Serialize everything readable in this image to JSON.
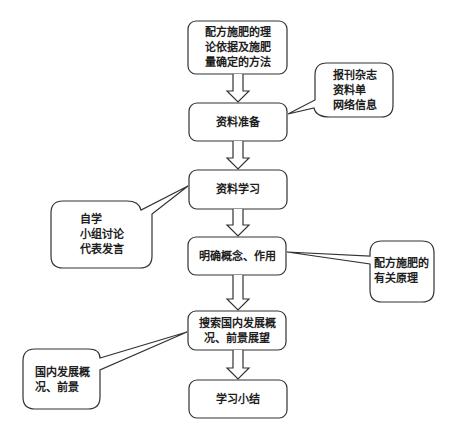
{
  "diagram": {
    "type": "flowchart",
    "steps": [
      {
        "id": "step1",
        "label": "配方施肥的理\n论依据及施肥\n量确定的方法"
      },
      {
        "id": "step2",
        "label": "资料准备"
      },
      {
        "id": "step3",
        "label": "资料学习"
      },
      {
        "id": "step4",
        "label": "明确概念、作用"
      },
      {
        "id": "step5",
        "label": "搜索国内发展概\n况、前景展望"
      },
      {
        "id": "step6",
        "label": "学习小结"
      }
    ],
    "callouts": [
      {
        "id": "callout-materials",
        "attached_to": "step2",
        "label": "报刊杂志\n资料单\n网络信息"
      },
      {
        "id": "callout-study",
        "attached_to": "step3",
        "label": "自学\n小组讨论\n代表发言"
      },
      {
        "id": "callout-principles",
        "attached_to": "step4",
        "label": "配方施肥的\n有关原理"
      },
      {
        "id": "callout-domestic",
        "attached_to": "step5",
        "label": "国内发展概\n况、前景"
      }
    ],
    "edges": [
      [
        "step1",
        "step2"
      ],
      [
        "step2",
        "step3"
      ],
      [
        "step3",
        "step4"
      ],
      [
        "step4",
        "step5"
      ],
      [
        "step5",
        "step6"
      ]
    ],
    "colors": {
      "stroke": "#333333",
      "fill": "#ffffff",
      "text": "#1e1e1e"
    }
  }
}
